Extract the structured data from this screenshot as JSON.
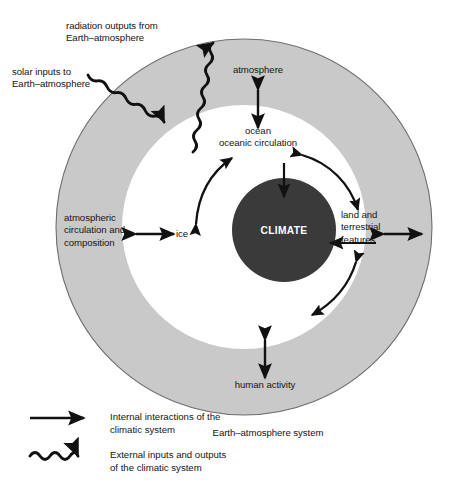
{
  "diagram": {
    "colors": {
      "outer_ring_fill": "#c9c9c9",
      "outer_ring_stroke": "#6f6f6f",
      "inner_disc_fill": "#ffffff",
      "core_fill": "#3a3a3a",
      "arrow": "#111111",
      "text": "#141414",
      "core_text": "#ffffff",
      "background": "#ffffff"
    },
    "core": {
      "label": "CLIMATE"
    },
    "system_label": "Earth–atmosphere system",
    "outer_ring_labels": [
      {
        "name": "atmosphere",
        "label": "atmosphere"
      },
      {
        "name": "human-activity",
        "label": "human activity"
      },
      {
        "name": "atmospheric-circulation-and-composition",
        "label": "atmospheric\ncirculation and\ncomposition"
      }
    ],
    "inner_labels": [
      {
        "name": "ocean-oceanic-circulation",
        "label": "ocean\noceanic circulation"
      },
      {
        "name": "ice",
        "label": "ice"
      },
      {
        "name": "land-and-terrestrial-features",
        "label": "land and\nterrestrial\nfeatures"
      }
    ],
    "external_labels": [
      {
        "name": "radiation-outputs",
        "label": "radiation outputs from\nEarth–atmosphere"
      },
      {
        "name": "solar-inputs",
        "label": "solar inputs to\nEarth–atmosphere"
      }
    ],
    "legend": {
      "items": [
        {
          "name": "internal-interactions",
          "symbol": "straight-arrow-icon",
          "label": "Internal interactions of the\nclimatic system"
        },
        {
          "name": "external-inputs-outputs",
          "symbol": "wavy-arrow-icon",
          "label": "External inputs and outputs\nof the climatic system"
        }
      ]
    }
  }
}
